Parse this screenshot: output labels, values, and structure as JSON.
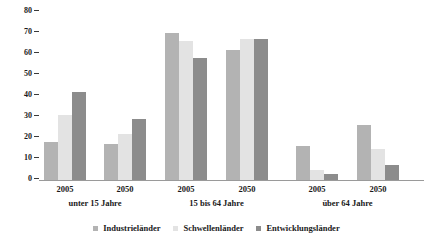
{
  "chart_data": {
    "type": "bar",
    "title": "",
    "subtitle": "",
    "xlabel": "",
    "ylabel": "",
    "ylim": [
      0,
      80
    ],
    "yticks": [
      0,
      10,
      20,
      30,
      40,
      50,
      60,
      70,
      80
    ],
    "grid": false,
    "legend_position": "bottom",
    "categories": [
      "2005",
      "2050",
      "2005",
      "2050",
      "2005",
      "2050"
    ],
    "group_labels": [
      "unter 15 Jahre",
      "15 bis 64 Jahre",
      "über 64 Jahre"
    ],
    "series": [
      {
        "name": "Industrieländer",
        "color": "#b3b3b3",
        "values": [
          18,
          17,
          70,
          62,
          16,
          26
        ]
      },
      {
        "name": "Schwellenländer",
        "color": "#e3e3e3",
        "values": [
          31,
          22,
          66,
          67,
          5,
          15
        ]
      },
      {
        "name": "Entwicklungsländer",
        "color": "#8c8c8c",
        "values": [
          42,
          29,
          58,
          67,
          3,
          7
        ]
      }
    ]
  },
  "axis": {
    "y_tick_labels": [
      "80",
      "70",
      "60",
      "50",
      "40",
      "30",
      "20",
      "10",
      "0"
    ]
  },
  "legend": {
    "items": [
      {
        "label": "Industrieländer"
      },
      {
        "label": "Schwellenländer"
      },
      {
        "label": "Entwicklungsländer"
      }
    ]
  }
}
